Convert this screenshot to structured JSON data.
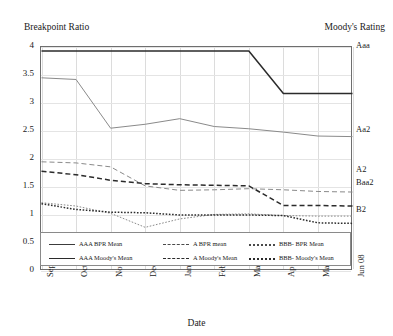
{
  "chart_data": {
    "type": "line",
    "title": "",
    "ylabel": "Breakpoint Ratio",
    "ylabel_right": "Moody's Rating",
    "xlabel": "Date",
    "grid": true,
    "legend_position": "bottom-inside",
    "ylim": [
      0,
      4
    ],
    "yticks": [
      "0",
      "0.5",
      "1",
      "1.5",
      "2",
      "2.5",
      "3",
      "3.5",
      "4"
    ],
    "ytick_values": [
      0,
      0.5,
      1,
      1.5,
      2,
      2.5,
      3,
      3.5,
      4
    ],
    "right_axis_ticks": [
      {
        "label": "Aaa",
        "value": 4.0
      },
      {
        "label": "Aa2",
        "value": 2.5
      },
      {
        "label": "A2",
        "value": 1.78
      },
      {
        "label": "Baa2",
        "value": 1.55
      },
      {
        "label": "B2",
        "value": 1.08
      }
    ],
    "categories": [
      "Sep 07",
      "Oct 07",
      "Nov 07",
      "Dec 07",
      "Jan 08",
      "Feb 08",
      "Mar 08",
      "Apr 08",
      "May 08",
      "Jun 08"
    ],
    "series": [
      {
        "name": "AAA BPR Mean",
        "style": "solid",
        "weight": "thin",
        "color": "#8a8a8a",
        "values": [
          3.45,
          3.42,
          2.55,
          2.62,
          2.72,
          2.58,
          2.54,
          2.48,
          2.41,
          2.4
        ]
      },
      {
        "name": "AAA Moody's Mean",
        "style": "solid",
        "weight": "bold",
        "color": "#2b2b2b",
        "values": [
          3.93,
          3.93,
          3.93,
          3.93,
          3.93,
          3.93,
          3.93,
          3.17,
          3.17,
          3.17
        ]
      },
      {
        "name": "A BPR mean",
        "style": "dashed",
        "weight": "thin",
        "color": "#8a8a8a",
        "values": [
          1.95,
          1.93,
          1.86,
          1.52,
          1.44,
          1.45,
          1.47,
          1.45,
          1.42,
          1.41
        ]
      },
      {
        "name": "A Moody's Mean",
        "style": "dashed",
        "weight": "bold",
        "color": "#2b2b2b",
        "values": [
          1.78,
          1.72,
          1.62,
          1.56,
          1.54,
          1.53,
          1.52,
          1.17,
          1.17,
          1.16
        ]
      },
      {
        "name": "BBB- BPR Mean",
        "style": "dotted",
        "weight": "thin",
        "color": "#8a8a8a",
        "values": [
          1.22,
          1.16,
          1.03,
          0.78,
          0.93,
          1.01,
          1.02,
          0.99,
          0.98,
          0.98
        ]
      },
      {
        "name": "BBB- Moody's Mean",
        "style": "dotted",
        "weight": "bold",
        "color": "#2b2b2b",
        "values": [
          1.2,
          1.1,
          1.05,
          1.04,
          1.0,
          1.0,
          1.0,
          0.99,
          0.86,
          0.85
        ]
      }
    ],
    "legend": [
      "AAA BPR Mean",
      "A BPR mean",
      "BBB- BPR Mean",
      "AAA Moody's Mean",
      "A Moody's Mean",
      "BBB- Moody's Mean"
    ]
  }
}
